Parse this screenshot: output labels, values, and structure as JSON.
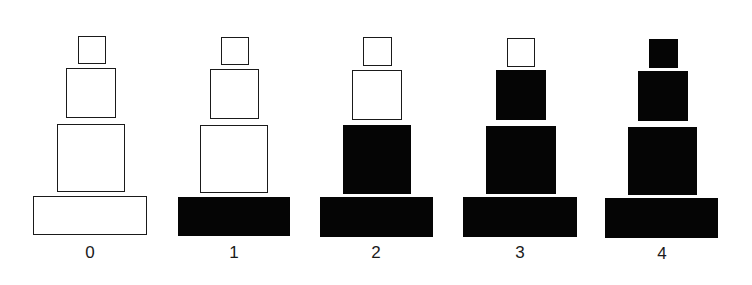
{
  "diagram": {
    "colors": {
      "filled": "#050505",
      "empty": "#ffffff",
      "outline": "#1a1a1a"
    },
    "towers": [
      {
        "label": "0",
        "filled_count": 0
      },
      {
        "label": "1",
        "filled_count": 1
      },
      {
        "label": "2",
        "filled_count": 2
      },
      {
        "label": "3",
        "filled_count": 3
      },
      {
        "label": "4",
        "filled_count": 4
      }
    ]
  }
}
